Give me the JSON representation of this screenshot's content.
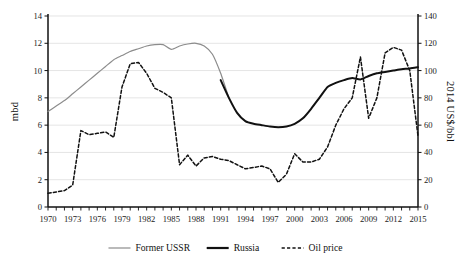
{
  "chart_data": {
    "type": "line",
    "title": "",
    "xlabel": "",
    "ylabel": "mbd",
    "y2label": "2014 US$/bbl",
    "xlim": [
      1970,
      2015
    ],
    "ylim": [
      0,
      14
    ],
    "y2lim": [
      0,
      140
    ],
    "yticks": [
      0,
      2,
      4,
      6,
      8,
      10,
      12,
      14
    ],
    "y2ticks": [
      0,
      20,
      40,
      60,
      80,
      100,
      120,
      140
    ],
    "xticks": [
      1970,
      1973,
      1976,
      1979,
      1982,
      1985,
      1988,
      1991,
      1994,
      1997,
      2000,
      2003,
      2006,
      2009,
      2012,
      2015
    ],
    "xtick_labels": [
      "1970",
      "1973",
      "1976",
      "1979",
      "1982",
      "1985",
      "1988",
      "1991",
      "1994",
      "1997",
      "2000",
      "2003",
      "2006",
      "2009",
      "2012",
      "2015"
    ],
    "ytick_labels": [
      "0",
      "2",
      "4",
      "6",
      "8",
      "10",
      "12",
      "14"
    ],
    "y2tick_labels": [
      "0",
      "20",
      "40",
      "60",
      "80",
      "100",
      "120",
      "140"
    ],
    "x_minor_ticks_every": 1,
    "grid": "horizontal",
    "legend_position": "bottom",
    "series": [
      {
        "name": "Former USSR",
        "axis": "left",
        "units": "mbd",
        "style": "solid-thin",
        "color": "#8c8c8c",
        "x": [
          1970,
          1971,
          1972,
          1973,
          1974,
          1975,
          1976,
          1977,
          1978,
          1979,
          1980,
          1981,
          1982,
          1983,
          1984,
          1985,
          1986,
          1987,
          1988,
          1989,
          1990,
          1991,
          1992
        ],
        "values": [
          7.0,
          7.4,
          7.8,
          8.3,
          8.8,
          9.3,
          9.8,
          10.3,
          10.8,
          11.1,
          11.4,
          11.6,
          11.8,
          11.9,
          11.9,
          11.55,
          11.8,
          11.95,
          12.0,
          11.8,
          11.2,
          9.8,
          8.0
        ]
      },
      {
        "name": "Russia",
        "axis": "left",
        "units": "mbd",
        "style": "solid-thick",
        "color": "#111111",
        "x": [
          1991,
          1992,
          1993,
          1994,
          1995,
          1996,
          1997,
          1998,
          1999,
          2000,
          2001,
          2002,
          2003,
          2004,
          2005,
          2006,
          2007,
          2008,
          2009,
          2010,
          2011,
          2012,
          2013,
          2014,
          2015
        ],
        "values": [
          9.3,
          8.0,
          6.9,
          6.3,
          6.1,
          6.0,
          5.9,
          5.85,
          5.9,
          6.1,
          6.5,
          7.2,
          8.0,
          8.8,
          9.1,
          9.3,
          9.45,
          9.35,
          9.6,
          9.8,
          9.9,
          10.0,
          10.1,
          10.15,
          10.25
        ]
      },
      {
        "name": "Oil price",
        "axis": "right",
        "units": "2014 US$/bbl",
        "style": "dashed",
        "color": "#111111",
        "x": [
          1970,
          1971,
          1972,
          1973,
          1974,
          1975,
          1976,
          1977,
          1978,
          1979,
          1980,
          1981,
          1982,
          1983,
          1984,
          1985,
          1986,
          1987,
          1988,
          1989,
          1990,
          1991,
          1992,
          1993,
          1994,
          1995,
          1996,
          1997,
          1998,
          1999,
          2000,
          2001,
          2002,
          2003,
          2004,
          2005,
          2006,
          2007,
          2008,
          2009,
          2010,
          2011,
          2012,
          2013,
          2014,
          2015
        ],
        "values": [
          10,
          11,
          12,
          16,
          56,
          53,
          54,
          55,
          51,
          88,
          105,
          106,
          98,
          87,
          84,
          80,
          31,
          38,
          30,
          36,
          37,
          35,
          34,
          31,
          28,
          29,
          30,
          28,
          18,
          24,
          39,
          33,
          33,
          35,
          44,
          60,
          72,
          80,
          110,
          65,
          80,
          113,
          117,
          115,
          100,
          52
        ]
      }
    ]
  },
  "legend": {
    "items": [
      {
        "label": "Former USSR",
        "swatch": "solid-thin-gray"
      },
      {
        "label": "Russia",
        "swatch": "solid-thick-black"
      },
      {
        "label": "Oil price",
        "swatch": "dashed-black"
      }
    ]
  },
  "axes": {
    "left_title": "mbd",
    "right_title": "2014 US$/bbl"
  },
  "colors": {
    "former_ussr": "#8c8c8c",
    "russia": "#111111",
    "oil_price": "#111111",
    "grid": "#d8d8d8",
    "axis": "#111111",
    "background": "#ffffff"
  }
}
